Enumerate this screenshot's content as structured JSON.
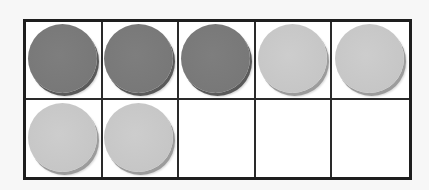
{
  "ten_frame": {
    "rows": 2,
    "columns": 5,
    "total_cells": 10,
    "filled_count": 7,
    "empty_count": 3,
    "dark_count": 3,
    "light_count": 4,
    "colors": {
      "dark_counter": "#7a7a7a",
      "light_counter": "#c6c6c6",
      "grid_line": "#1e1e1e",
      "cell_background": "#ffffff"
    },
    "cells": [
      {
        "row": 1,
        "col": 1,
        "counter": "dark"
      },
      {
        "row": 1,
        "col": 2,
        "counter": "dark"
      },
      {
        "row": 1,
        "col": 3,
        "counter": "dark"
      },
      {
        "row": 1,
        "col": 4,
        "counter": "light"
      },
      {
        "row": 1,
        "col": 5,
        "counter": "light"
      },
      {
        "row": 2,
        "col": 1,
        "counter": "light"
      },
      {
        "row": 2,
        "col": 2,
        "counter": "light"
      },
      {
        "row": 2,
        "col": 3,
        "counter": "empty"
      },
      {
        "row": 2,
        "col": 4,
        "counter": "empty"
      },
      {
        "row": 2,
        "col": 5,
        "counter": "empty"
      }
    ]
  }
}
